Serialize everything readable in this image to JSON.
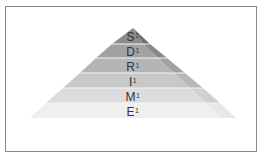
{
  "diagram": {
    "type": "pyramid",
    "levels": [
      {
        "letter": "S",
        "sup": "1",
        "fill": "#8c8c8c",
        "side": "#6f6f6f"
      },
      {
        "letter": "D",
        "sup": "1",
        "fill": "#a2a2a2",
        "side": "#888888"
      },
      {
        "letter": "R",
        "sup": "1",
        "fill": "#b5b5b5",
        "side": "#a0a0a0"
      },
      {
        "letter": "I",
        "sup": "1",
        "fill": "#c8c8c8",
        "side": "#b8b8b8"
      },
      {
        "letter": "M",
        "sup": "1",
        "fill": "#dcdcdc",
        "side": "#d0d0d0"
      },
      {
        "letter": "E",
        "sup": "1",
        "fill": "#efefef",
        "side": "#e8e8e8"
      }
    ]
  }
}
